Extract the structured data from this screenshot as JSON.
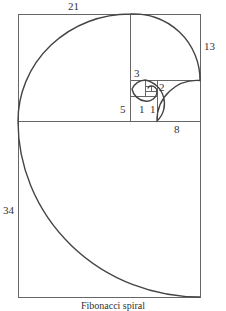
{
  "diagram": {
    "title": "Fibonacci spiral",
    "stroke_color": "#555555",
    "spiral_color": "#444444",
    "squares": [
      {
        "size": 21,
        "label": "21"
      },
      {
        "size": 13,
        "label": "13"
      },
      {
        "size": 8,
        "label": "8"
      },
      {
        "size": 5,
        "label": "5"
      },
      {
        "size": 3,
        "label": "3"
      },
      {
        "size": 2,
        "label": "2"
      },
      {
        "size": 1,
        "label": "1"
      },
      {
        "size": 1,
        "label": "1"
      },
      {
        "size": 34,
        "label": "34"
      }
    ]
  }
}
